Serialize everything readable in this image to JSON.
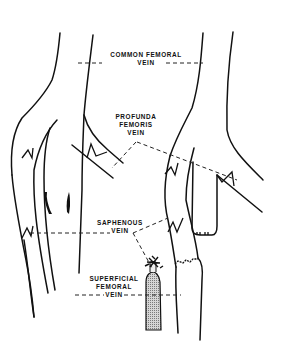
{
  "diagram": {
    "labels": {
      "common_femoral": {
        "line1": "COMMON FEMORAL",
        "line2": "VEIN"
      },
      "profunda_femoris": {
        "line1": "PROFUNDA",
        "line2": "FEMORIS",
        "line3": "VEIN"
      },
      "saphenous": {
        "line1": "SAPHENOUS",
        "line2": "VEIN"
      },
      "superficial_femoral": {
        "line1": "SUPERFICIAL",
        "line2": "FEMORAL",
        "line3": "VEIN"
      }
    },
    "colors": {
      "line": "#111111",
      "background": "#ffffff",
      "ligated_stump_fill": "#b8b8b8"
    }
  }
}
